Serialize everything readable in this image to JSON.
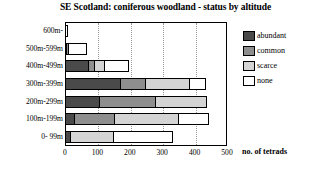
{
  "chart_data": {
    "type": "bar",
    "orientation": "horizontal",
    "stacked": true,
    "title": "SE Scotland: coniferous woodland - status by altitude",
    "xlabel": "no. of tetrads",
    "ylabel": "",
    "xlim": [
      0,
      500
    ],
    "xticks": [
      0,
      100,
      200,
      300,
      400,
      500
    ],
    "grid": false,
    "legend_position": "right",
    "categories": [
      "600m-",
      "500m-599m",
      "400m-499m",
      "300m-399m",
      "200m-299m",
      "100m-199m",
      "0- 99m"
    ],
    "series": [
      {
        "name": "abundant",
        "color": "#4a4a4a",
        "values": [
          0,
          6,
          74,
          173,
          108,
          31,
          18
        ]
      },
      {
        "name": "common",
        "color": "#8e8e8e",
        "values": [
          0,
          9,
          22,
          80,
          176,
          126,
          0
        ]
      },
      {
        "name": "scarce",
        "color": "#d4d4d4",
        "values": [
          0,
          0,
          34,
          139,
          160,
          201,
          136
        ]
      },
      {
        "name": "none",
        "color": "#ffffff",
        "values": [
          10,
          57,
          77,
          52,
          0,
          96,
          185
        ]
      }
    ]
  },
  "legend": {
    "items": [
      {
        "label": "abundant",
        "color": "#4a4a4a"
      },
      {
        "label": "common",
        "color": "#8e8e8e"
      },
      {
        "label": "scarce",
        "color": "#d4d4d4"
      },
      {
        "label": "none",
        "color": "#ffffff"
      }
    ]
  }
}
